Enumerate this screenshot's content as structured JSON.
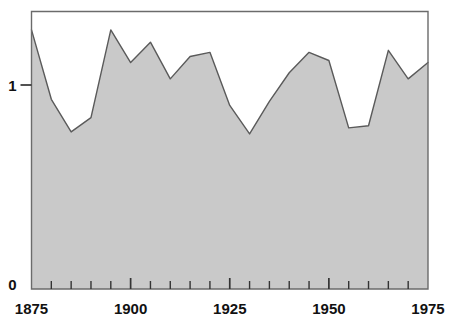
{
  "chart_data": {
    "type": "area",
    "title": "",
    "subtitle": "",
    "xlabel": "",
    "ylabel": "",
    "x": [
      1875,
      1880,
      1885,
      1890,
      1895,
      1900,
      1905,
      1910,
      1915,
      1920,
      1925,
      1930,
      1935,
      1940,
      1945,
      1950,
      1955,
      1960,
      1965,
      1970,
      1975
    ],
    "values": [
      1.27,
      0.93,
      0.77,
      0.84,
      1.27,
      1.11,
      1.21,
      1.03,
      1.14,
      1.16,
      0.9,
      0.76,
      0.92,
      1.06,
      1.16,
      1.12,
      0.79,
      0.8,
      1.17,
      1.03,
      1.11
    ],
    "series": [
      {
        "name": "series-1",
        "values": [
          1.27,
          0.93,
          0.77,
          0.84,
          1.27,
          1.11,
          1.21,
          1.03,
          1.14,
          1.16,
          0.9,
          0.76,
          0.92,
          1.06,
          1.16,
          1.12,
          0.79,
          0.8,
          1.17,
          1.03,
          1.11
        ]
      }
    ],
    "xlim": [
      1875,
      1975
    ],
    "ylim": [
      0,
      1.365
    ],
    "grid": false,
    "legend": null,
    "x_tick_labels": [
      "1875",
      "1900",
      "1925",
      "1950",
      "1975"
    ],
    "x_tick_values": [
      1875,
      1900,
      1925,
      1950,
      1975
    ],
    "x_minor_tick_values": [
      1880,
      1885,
      1890,
      1895,
      1905,
      1910,
      1915,
      1920,
      1930,
      1935,
      1940,
      1945,
      1955,
      1960,
      1965,
      1970
    ],
    "y_tick_labels": [
      "0",
      "1"
    ],
    "y_tick_values": [
      0,
      1
    ],
    "colors": {
      "area_fill": "#c9c9c9",
      "line_stroke": "#5a5a5a",
      "frame": "#555555",
      "axis_text": "#111111",
      "background": "#ffffff"
    }
  }
}
